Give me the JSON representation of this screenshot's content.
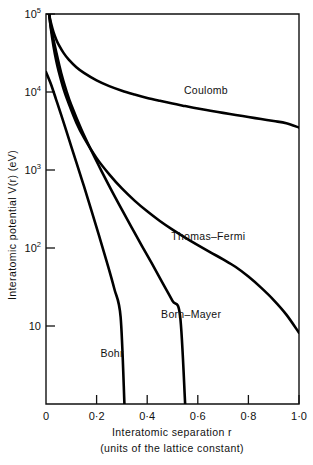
{
  "chart_data": {
    "type": "line",
    "title": "",
    "xlabel": "Interatomic separation r",
    "xlabel_line2": "(units of the lattice constant)",
    "ylabel": "Interatomic potential  V(r)   (eV)",
    "xlim": [
      0,
      1.0
    ],
    "ylim": [
      1,
      100000
    ],
    "yscale": "log",
    "xscale": "linear",
    "grid": false,
    "legend": "inline-labels",
    "xticks": [
      0,
      0.2,
      0.4,
      0.6,
      0.8,
      1.0
    ],
    "xtick_labels": [
      "0",
      "0·2",
      "0·4",
      "0·6",
      "0·8",
      "1·0"
    ],
    "yticks": [
      100000,
      10000,
      1000,
      100,
      10
    ],
    "ytick_labels": [
      {
        "mantissa": "10",
        "exponent": "5"
      },
      {
        "mantissa": "10",
        "exponent": "4"
      },
      {
        "mantissa": "10",
        "exponent": "3"
      },
      {
        "mantissa": "10",
        "exponent": "2"
      },
      {
        "mantissa": "10",
        "exponent": ""
      }
    ],
    "series": [
      {
        "name": "Coulomb",
        "label": "Coulomb",
        "label_x": 0.545,
        "label_y": 9500,
        "x": [
          0.012,
          0.02,
          0.03,
          0.04,
          0.05,
          0.07,
          0.09,
          0.12,
          0.15,
          0.2,
          0.25,
          0.3,
          0.35,
          0.4,
          0.45,
          0.5,
          0.55,
          0.6,
          0.65,
          0.7,
          0.75,
          0.8,
          0.85,
          0.9,
          0.95,
          1.0
        ],
        "y": [
          100000,
          76000,
          58000,
          47500,
          40500,
          31500,
          26000,
          20800,
          17600,
          14100,
          11900,
          10400,
          9300,
          8400,
          7700,
          7100,
          6600,
          6150,
          5750,
          5400,
          5080,
          4780,
          4500,
          4240,
          3980,
          3500
        ]
      },
      {
        "name": "Thomas-Fermi",
        "label": "Thomas–Fermi",
        "label_x": 0.495,
        "label_y": 128,
        "x": [
          0.013,
          0.02,
          0.03,
          0.04,
          0.05,
          0.07,
          0.09,
          0.12,
          0.15,
          0.2,
          0.25,
          0.3,
          0.35,
          0.4,
          0.45,
          0.5,
          0.55,
          0.6,
          0.65,
          0.7,
          0.75,
          0.8,
          0.85,
          0.9,
          0.95,
          1.0
        ],
        "y": [
          100000,
          62000,
          38000,
          25500,
          18500,
          10800,
          7100,
          4050,
          2600,
          1420,
          880,
          580,
          405,
          295,
          222,
          172,
          136,
          109,
          88,
          71.5,
          57,
          43,
          31,
          21.5,
          14,
          8.2
        ]
      },
      {
        "name": "Born-Mayer",
        "label": "Born–Mayer",
        "label_x": 0.455,
        "label_y": 12.5,
        "x": [
          0.012,
          0.02,
          0.04,
          0.06,
          0.08,
          0.1,
          0.14,
          0.18,
          0.22,
          0.26,
          0.3,
          0.34,
          0.38,
          0.42,
          0.46,
          0.5,
          0.53,
          0.55
        ],
        "y": [
          100000,
          66000,
          33000,
          17500,
          10500,
          6800,
          3300,
          1750,
          960,
          540,
          310,
          180,
          105,
          62,
          36,
          21,
          13.5,
          1.0
        ]
      },
      {
        "name": "Bohr",
        "label": "Bohr",
        "label_x": 0.215,
        "label_y": 4.0,
        "x": [
          0.0,
          0.02,
          0.04,
          0.06,
          0.08,
          0.1,
          0.12,
          0.15,
          0.18,
          0.21,
          0.24,
          0.27,
          0.295,
          0.31
        ],
        "y": [
          18000,
          12500,
          8000,
          5100,
          3200,
          2000,
          1250,
          620,
          300,
          143,
          67,
          30,
          13,
          1.0
        ]
      }
    ]
  }
}
